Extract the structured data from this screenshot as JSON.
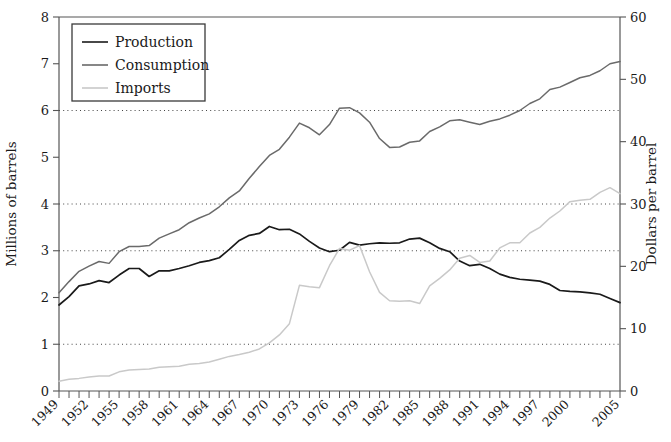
{
  "chart_data": {
    "type": "line",
    "title": "",
    "xlabel": "",
    "ylabel": "Millions of barrels",
    "y2label": "Dollars per barrel",
    "ylim": [
      0,
      8
    ],
    "y2lim": [
      0,
      60
    ],
    "yticks": [
      0,
      1,
      2,
      3,
      4,
      5,
      6,
      7,
      8
    ],
    "y2ticks": [
      0,
      10,
      20,
      30,
      40,
      50,
      60
    ],
    "gridlines_y": [
      1,
      3,
      4,
      6
    ],
    "grid": "dotted horizontal at 1,3,4,6",
    "legend_position": "top-left inside plot",
    "x_start": 1949,
    "x_end": 2005,
    "x_tick_step": 1,
    "x_label_step": 3,
    "xticklabels": [
      "1949",
      "1952",
      "1955",
      "1958",
      "1961",
      "1964",
      "1967",
      "1970",
      "1973",
      "1976",
      "1979",
      "1982",
      "1985",
      "1988",
      "1991",
      "1994",
      "1997",
      "2000",
      "2005"
    ],
    "x": [
      1949,
      1950,
      1951,
      1952,
      1953,
      1954,
      1955,
      1956,
      1957,
      1958,
      1959,
      1960,
      1961,
      1962,
      1963,
      1964,
      1965,
      1966,
      1967,
      1968,
      1969,
      1970,
      1971,
      1972,
      1973,
      1974,
      1975,
      1976,
      1977,
      1978,
      1979,
      1980,
      1981,
      1982,
      1983,
      1984,
      1985,
      1986,
      1987,
      1988,
      1989,
      1990,
      1991,
      1992,
      1993,
      1994,
      1995,
      1996,
      1997,
      1998,
      1999,
      2000,
      2001,
      2002,
      2003,
      2004,
      2005
    ],
    "series": [
      {
        "name": "Production",
        "color": "#1a1a1a",
        "width": 1.7,
        "values": [
          1.84,
          2.02,
          2.25,
          2.29,
          2.36,
          2.32,
          2.48,
          2.62,
          2.62,
          2.45,
          2.57,
          2.57,
          2.62,
          2.68,
          2.75,
          2.79,
          2.85,
          3.03,
          3.22,
          3.33,
          3.37,
          3.52,
          3.45,
          3.46,
          3.36,
          3.2,
          3.06,
          2.98,
          3.01,
          3.18,
          3.12,
          3.15,
          3.17,
          3.16,
          3.17,
          3.25,
          3.27,
          3.17,
          3.05,
          2.98,
          2.78,
          2.68,
          2.71,
          2.62,
          2.5,
          2.43,
          2.39,
          2.37,
          2.35,
          2.28,
          2.15,
          2.13,
          2.12,
          2.1,
          2.07,
          1.98,
          1.89
        ]
      },
      {
        "name": "Consumption",
        "color": "#6a6a6a",
        "width": 1.5,
        "values": [
          2.1,
          2.34,
          2.56,
          2.67,
          2.77,
          2.73,
          2.98,
          3.09,
          3.09,
          3.11,
          3.27,
          3.36,
          3.45,
          3.6,
          3.7,
          3.79,
          3.94,
          4.13,
          4.28,
          4.55,
          4.8,
          5.04,
          5.17,
          5.43,
          5.73,
          5.63,
          5.48,
          5.7,
          6.05,
          6.06,
          5.95,
          5.75,
          5.4,
          5.21,
          5.22,
          5.32,
          5.35,
          5.55,
          5.65,
          5.78,
          5.8,
          5.75,
          5.7,
          5.77,
          5.82,
          5.9,
          6.0,
          6.15,
          6.25,
          6.45,
          6.5,
          6.6,
          6.7,
          6.75,
          6.85,
          7.0,
          7.05
        ]
      },
      {
        "name": "Imports",
        "color": "#c9c9c9",
        "width": 1.5,
        "values": [
          0.21,
          0.25,
          0.27,
          0.3,
          0.32,
          0.32,
          0.41,
          0.45,
          0.46,
          0.47,
          0.51,
          0.52,
          0.53,
          0.57,
          0.59,
          0.62,
          0.68,
          0.74,
          0.78,
          0.83,
          0.9,
          1.03,
          1.2,
          1.44,
          2.26,
          2.23,
          2.21,
          2.68,
          3.05,
          3.01,
          3.11,
          2.55,
          2.11,
          1.93,
          1.92,
          1.93,
          1.87,
          2.25,
          2.41,
          2.59,
          2.84,
          2.9,
          2.75,
          2.78,
          3.06,
          3.17,
          3.17,
          3.38,
          3.5,
          3.7,
          3.85,
          4.05,
          4.08,
          4.1,
          4.25,
          4.35,
          4.22
        ]
      }
    ],
    "legend": [
      {
        "label": "Production",
        "color": "#1a1a1a"
      },
      {
        "label": "Consumption",
        "color": "#6a6a6a"
      },
      {
        "label": "Imports",
        "color": "#c9c9c9"
      }
    ]
  }
}
